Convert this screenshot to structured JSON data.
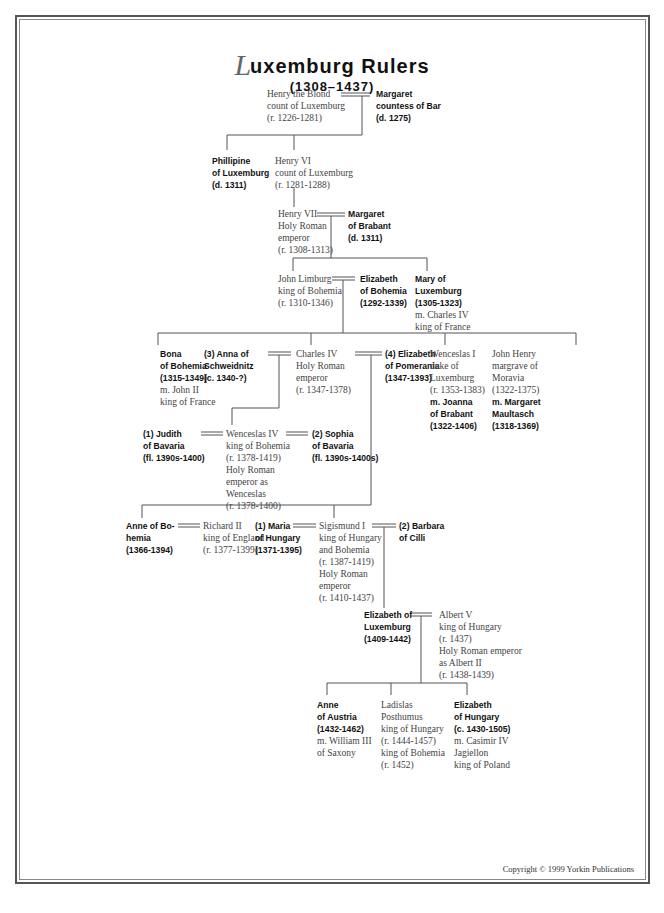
{
  "title": {
    "initial": "L",
    "rest": "uxemburg Rulers",
    "years": "(1308–1437)"
  },
  "copyright": "Copyright © 1999 Yorkin Publications",
  "people": {
    "henry_blond": [
      "Henry the Blond",
      "count of Luxemburg",
      "(r. 1226-1281)"
    ],
    "margaret_bar": [
      "Margaret",
      "countess of Bar",
      "(d. 1275)"
    ],
    "phillipine": [
      "Phillipine",
      "of Luxemburg",
      "(d. 1311)"
    ],
    "henry_vi": [
      "Henry VI",
      "count of Luxemburg",
      "(r. 1281-1288)"
    ],
    "henry_vii": [
      "Henry VII",
      "Holy Roman",
      "emperor",
      "(r. 1308-1313)"
    ],
    "margaret_brabant": [
      "Margaret",
      "of Brabant",
      "(d. 1311)"
    ],
    "john_limburg": [
      "John Limburg",
      "king of Bohemia",
      "(r. 1310-1346)"
    ],
    "elizabeth_bohemia": [
      "Elizabeth",
      "of Bohemia",
      "(1292-1339)"
    ],
    "mary_lux": {
      "bold": [
        "Mary of",
        "Luxemburg",
        "(1305-1323)"
      ],
      "plain": [
        "m. Charles IV",
        "king of France"
      ]
    },
    "bona": {
      "bold": [
        "Bona",
        "of Bohemia",
        "(1315-1349)"
      ],
      "plain": [
        "m. John II",
        "king of France"
      ]
    },
    "anna_schweidnitz": [
      "(3) Anna of",
      "Schweidnitz",
      "(c. 1340-?)"
    ],
    "charles_iv": [
      "Charles IV",
      "Holy Roman",
      "emperor",
      "(r. 1347-1378)"
    ],
    "elizabeth_pomerania": [
      "(4) Elizabeth",
      "of Pomerania",
      "(1347-1393)"
    ],
    "wenceslas_i": {
      "plain": [
        "Wenceslas I",
        "duke of",
        "Luxemburg",
        "(r. 1353-1383)"
      ],
      "bold": [
        "m. Joanna",
        "of Brabant",
        "(1322-1406)"
      ]
    },
    "john_henry": {
      "plain": [
        "John Henry",
        "margrave of",
        "Moravia",
        "(1322-1375)"
      ],
      "bold": [
        "m. Margaret",
        "Maultasch",
        "(1318-1369)"
      ]
    },
    "judith": [
      "(1) Judith",
      "of Bavaria",
      "(fl. 1390s-1400)"
    ],
    "wenceslas_iv": [
      "Wenceslas IV",
      "king of Bohemia",
      "(r. 1378-1419)",
      "Holy Roman",
      "emperor as",
      "Wenceslas",
      "(r. 1378-1400)"
    ],
    "sophia": [
      "(2) Sophia",
      "of Bavaria",
      "(fl. 1390s-1400s)"
    ],
    "anne_bohemia": [
      "Anne of Bo-",
      "hemia",
      "(1366-1394)"
    ],
    "richard_ii": [
      "Richard II",
      "king of England",
      "(r. 1377-1399)"
    ],
    "maria_hungary": [
      "(1) Maria",
      "of Hungary",
      "(1371-1395)"
    ],
    "sigismund": [
      "Sigismund I",
      "king of Hungary",
      "and Bohemia",
      "(r. 1387-1419)",
      "Holy Roman",
      "emperor",
      "(r. 1410-1437)"
    ],
    "barbara": [
      "(2) Barbara",
      "of Cilli"
    ],
    "elizabeth_lux": [
      "Elizabeth of",
      "Luxemburg",
      "(1409-1442)"
    ],
    "albert_v": [
      "Albert V",
      "king of Hungary",
      "(r. 1437)",
      "Holy Roman emperor",
      "as Albert II",
      "(r. 1438-1439)"
    ],
    "anne_austria": {
      "bold": [
        "Anne",
        "of Austria",
        "(1432-1462)"
      ],
      "plain": [
        "m. William III",
        "of Saxony"
      ]
    },
    "ladislas": [
      "Ladislas",
      "Posthumus",
      "king of Hungary",
      "(r. 1444-1457)",
      "king of Bohemia",
      "(r. 1452)"
    ],
    "elizabeth_hungary": {
      "bold": [
        "Elizabeth",
        "of Hungary",
        "(c. 1430-1505)"
      ],
      "plain": [
        "m. Casimir IV",
        "Jagiellon",
        "king of Poland"
      ]
    }
  }
}
